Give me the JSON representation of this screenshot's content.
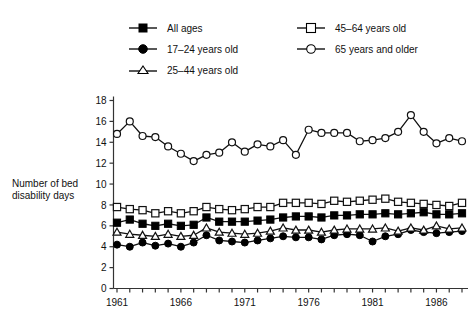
{
  "axis_title": "Number of bed\ndisability days",
  "axis_title_line1": "Number of bed",
  "axis_title_line2": "disability days",
  "colors": {
    "line": "#111111",
    "marker_fill_open": "#ffffff",
    "marker_fill_solid": "#000000",
    "axis": "#333333",
    "background": "#ffffff"
  },
  "legend": {
    "left_column": [
      {
        "label": "All ages",
        "marker": "filled-square"
      },
      {
        "label": "17–24 years old",
        "marker": "filled-circle"
      },
      {
        "label": "25–44 years old",
        "marker": "open-triangle"
      }
    ],
    "right_column": [
      {
        "label": "45–64 years old",
        "marker": "open-square"
      },
      {
        "label": "65 years and older",
        "marker": "open-circle"
      }
    ]
  },
  "chart_data": {
    "type": "line",
    "title": "",
    "xlabel": "",
    "ylabel": "Number of bed disability days",
    "xlim": [
      1961,
      1988
    ],
    "ylim": [
      0,
      18
    ],
    "ytick_step": 2,
    "yticks": [
      0,
      2,
      4,
      6,
      8,
      10,
      12,
      14,
      16,
      18
    ],
    "xticks": [
      1961,
      1962,
      1963,
      1964,
      1965,
      1966,
      1967,
      1968,
      1969,
      1970,
      1971,
      1972,
      1973,
      1974,
      1975,
      1976,
      1977,
      1978,
      1979,
      1980,
      1981,
      1982,
      1983,
      1984,
      1985,
      1986,
      1987,
      1988
    ],
    "xtick_labels": [
      "1961",
      "1966",
      "1971",
      "1976",
      "1981",
      "1986"
    ],
    "xtick_label_years": [
      1961,
      1966,
      1971,
      1976,
      1981,
      1986
    ],
    "grid": false,
    "legend_position": "top",
    "x": [
      1961,
      1962,
      1963,
      1964,
      1965,
      1966,
      1967,
      1968,
      1969,
      1970,
      1971,
      1972,
      1973,
      1974,
      1975,
      1976,
      1977,
      1978,
      1979,
      1980,
      1981,
      1982,
      1983,
      1984,
      1985,
      1986,
      1987,
      1988
    ],
    "series": [
      {
        "name": "All ages",
        "marker": "filled-square",
        "values": [
          6.3,
          6.6,
          6.2,
          6.0,
          6.2,
          6.0,
          6.1,
          6.8,
          6.4,
          6.4,
          6.4,
          6.5,
          6.6,
          6.8,
          6.9,
          6.9,
          6.8,
          7.0,
          7.0,
          7.1,
          7.1,
          7.2,
          7.1,
          7.2,
          7.3,
          7.1,
          7.1,
          7.2
        ]
      },
      {
        "name": "17–24 years old",
        "marker": "filled-circle",
        "values": [
          4.2,
          4.0,
          4.4,
          4.1,
          4.3,
          4.0,
          4.4,
          5.1,
          4.6,
          4.5,
          4.4,
          4.6,
          4.8,
          5.0,
          4.9,
          4.9,
          4.7,
          5.1,
          5.2,
          5.1,
          4.5,
          5.0,
          5.2,
          5.6,
          5.4,
          5.3,
          5.4,
          5.5
        ]
      },
      {
        "name": "25–44 years old",
        "marker": "open-triangle",
        "values": [
          5.4,
          5.2,
          5.1,
          5.0,
          5.2,
          5.0,
          5.1,
          5.8,
          5.4,
          5.3,
          5.2,
          5.3,
          5.5,
          5.8,
          5.6,
          5.6,
          5.4,
          5.6,
          5.7,
          5.7,
          5.7,
          5.8,
          5.5,
          5.8,
          5.6,
          6.0,
          5.7,
          5.8
        ]
      },
      {
        "name": "45–64 years old",
        "marker": "open-square",
        "values": [
          7.8,
          7.6,
          7.5,
          7.2,
          7.4,
          7.2,
          7.4,
          7.8,
          7.6,
          7.5,
          7.6,
          7.8,
          7.8,
          8.2,
          8.2,
          8.2,
          8.1,
          8.4,
          8.3,
          8.4,
          8.5,
          8.6,
          8.3,
          8.2,
          8.1,
          8.0,
          7.9,
          8.2
        ]
      },
      {
        "name": "65 years and older",
        "marker": "open-circle",
        "values": [
          14.8,
          16.0,
          14.6,
          14.5,
          13.6,
          12.9,
          12.2,
          12.8,
          13.0,
          14.0,
          13.1,
          13.8,
          13.6,
          14.2,
          12.8,
          15.2,
          14.9,
          14.9,
          14.9,
          14.1,
          14.2,
          14.4,
          15.0,
          16.6,
          15.0,
          13.9,
          14.4,
          14.1
        ]
      }
    ]
  }
}
